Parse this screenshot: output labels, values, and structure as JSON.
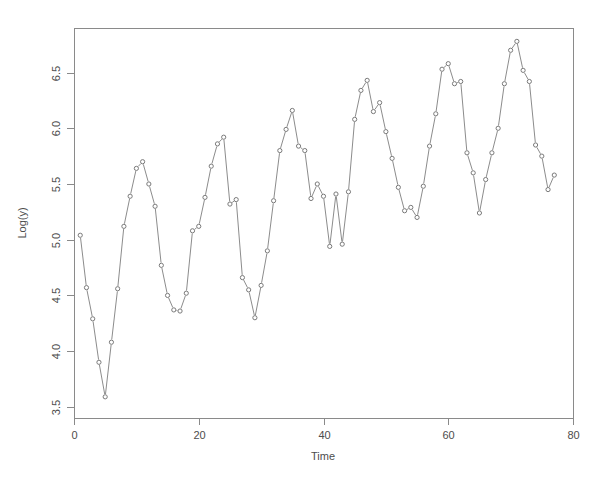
{
  "chart_data": {
    "type": "line",
    "title": "",
    "xlabel": "Time",
    "ylabel": "Log(y)",
    "xlim": [
      0,
      80
    ],
    "ylim": [
      3.4,
      6.9
    ],
    "grid": false,
    "legend": null,
    "marker": "open-circle",
    "line_color": "#8c8c8c",
    "marker_color": "#7a7a7a",
    "axis_color": "#8a8a8a",
    "background": "#ffffff",
    "xticks": [
      0,
      20,
      40,
      60,
      80
    ],
    "xtick_labels": [
      "0",
      "20",
      "40",
      "60",
      "80"
    ],
    "yticks": [
      3.5,
      4.0,
      4.5,
      5.0,
      5.5,
      6.0,
      6.5
    ],
    "ytick_labels": [
      "3.5",
      "4.0",
      "4.5",
      "5.0",
      "5.5",
      "6.0",
      "6.5"
    ],
    "series": [
      {
        "name": "Log(y)",
        "x": [
          1,
          2,
          3,
          4,
          5,
          6,
          7,
          8,
          9,
          10,
          11,
          12,
          13,
          14,
          15,
          16,
          17,
          18,
          19,
          20,
          21,
          22,
          23,
          24,
          25,
          26,
          27,
          28,
          29,
          30,
          31,
          32,
          33,
          34,
          35,
          36,
          37,
          38,
          39,
          40,
          41,
          42,
          43,
          44,
          45,
          46,
          47,
          48,
          49,
          50,
          51,
          52,
          53,
          54,
          55,
          56,
          57,
          58,
          59,
          60,
          61,
          62,
          63,
          64,
          65,
          66,
          67,
          68,
          69,
          70,
          71,
          72,
          73,
          74,
          75,
          76,
          77
        ],
        "y": [
          5.04,
          4.57,
          4.29,
          3.9,
          3.59,
          4.08,
          4.56,
          5.12,
          5.39,
          5.64,
          5.7,
          5.5,
          5.3,
          4.77,
          4.5,
          4.37,
          4.36,
          4.52,
          5.08,
          5.12,
          5.38,
          5.66,
          5.86,
          5.92,
          5.32,
          5.36,
          4.66,
          4.55,
          4.3,
          4.59,
          4.9,
          5.35,
          5.8,
          5.99,
          6.16,
          5.84,
          5.8,
          5.37,
          5.5,
          5.39,
          4.94,
          5.41,
          4.96,
          5.43,
          6.08,
          6.34,
          6.43,
          6.15,
          6.23,
          5.97,
          5.73,
          5.47,
          5.26,
          5.29,
          5.2,
          5.48,
          5.84,
          6.13,
          6.53,
          6.58,
          6.4,
          6.42,
          5.78,
          5.6,
          5.24,
          5.54,
          5.78,
          6.0,
          6.4,
          6.7,
          6.78,
          6.52,
          6.42,
          5.85,
          5.75,
          5.45,
          5.58
        ]
      }
    ]
  },
  "axes": {
    "y_label": "Log(y)",
    "x_label": "Time"
  },
  "geometry": {
    "plot_left": 74,
    "plot_right": 573,
    "plot_top": 28,
    "plot_bottom": 418
  }
}
